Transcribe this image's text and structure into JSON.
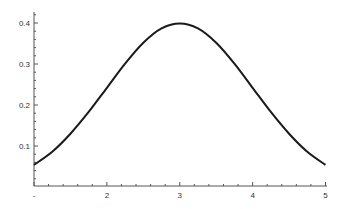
{
  "chart_data": {
    "type": "line",
    "title": "",
    "xlabel": "",
    "ylabel": "",
    "xlim": [
      1,
      5
    ],
    "ylim": [
      0,
      0.42
    ],
    "grid": false,
    "legend": null,
    "x_ticks": [
      {
        "value": 1,
        "label": "-"
      },
      {
        "value": 2,
        "label": "2"
      },
      {
        "value": 3,
        "label": "3"
      },
      {
        "value": 4,
        "label": "4"
      },
      {
        "value": 5,
        "label": "5"
      }
    ],
    "x_minor_step": 0.2,
    "y_ticks": [
      {
        "value": 0.1,
        "label": "0.1"
      },
      {
        "value": 0.2,
        "label": "0.2"
      },
      {
        "value": 0.3,
        "label": "0.3"
      },
      {
        "value": 0.4,
        "label": "0.4"
      }
    ],
    "y_minor_step": 0.02,
    "series": [
      {
        "name": "normal PDF (mean 3, sd 1)",
        "color": "#1a1a1a",
        "x": [
          1.0,
          1.25,
          1.5,
          1.75,
          2.0,
          2.25,
          2.5,
          2.75,
          3.0,
          3.25,
          3.5,
          3.75,
          4.0,
          4.25,
          4.5,
          4.75,
          5.0
        ],
        "y": [
          0.054,
          0.086,
          0.13,
          0.183,
          0.242,
          0.301,
          0.352,
          0.387,
          0.399,
          0.387,
          0.352,
          0.301,
          0.242,
          0.183,
          0.13,
          0.086,
          0.054
        ]
      }
    ]
  }
}
